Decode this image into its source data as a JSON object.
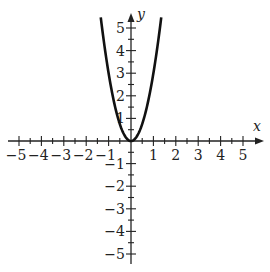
{
  "chart_data": {
    "type": "line",
    "title": "",
    "function": "y = 3x^2",
    "xlabel": "x",
    "ylabel": "y",
    "xlim": [
      -5.5,
      5.9
    ],
    "ylim": [
      -5.5,
      5.6
    ],
    "x_ticks": [
      -5,
      -4,
      -3,
      -2,
      -1,
      1,
      2,
      3,
      4,
      5
    ],
    "y_ticks": [
      -5,
      -4,
      -3,
      -2,
      -1,
      1,
      2,
      3,
      4,
      5
    ],
    "minor_tick_step": 0.5,
    "grid": false,
    "legend": null,
    "series": [
      {
        "name": "parabola",
        "x": [
          -1.35,
          -1.2,
          -1.0,
          -0.8,
          -0.6,
          -0.4,
          -0.2,
          0,
          0.2,
          0.4,
          0.6,
          0.8,
          1.0,
          1.2,
          1.35
        ],
        "y": [
          5.47,
          4.32,
          3.0,
          1.92,
          1.08,
          0.48,
          0.12,
          0,
          0.12,
          0.48,
          1.08,
          1.92,
          3.0,
          4.32,
          5.47
        ],
        "color": "#111111"
      }
    ]
  },
  "axes": {
    "x_name": "x",
    "y_name": "y",
    "x_tick_labels": [
      "−5",
      "−4",
      "−3",
      "−2",
      "−1",
      "1",
      "2",
      "3",
      "4",
      "5"
    ],
    "y_tick_labels_pos": [
      "1",
      "2",
      "3",
      "4",
      "5"
    ],
    "y_tick_labels_neg": [
      "−1",
      "−2",
      "−3",
      "−4",
      "−5"
    ]
  },
  "colors": {
    "axis": "#222222",
    "curve": "#111111"
  }
}
